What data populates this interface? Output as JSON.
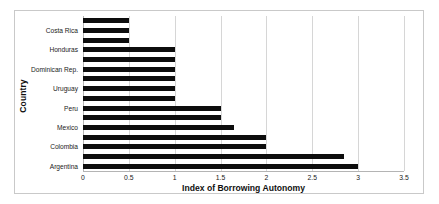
{
  "chart_data": {
    "type": "bar",
    "orientation": "horizontal",
    "title": "",
    "xlabel": "Index of Borrowing Autonomy",
    "ylabel": "Country",
    "xlim": [
      0,
      3.5
    ],
    "xticks": [
      "0",
      "0.5",
      "1",
      "1.5",
      "2",
      "2.5",
      "3",
      "3.5"
    ],
    "xtick_values": [
      0,
      0.5,
      1,
      1.5,
      2,
      2.5,
      3,
      3.5
    ],
    "grid": true,
    "grid_axis": "x",
    "legend": false,
    "bar_color": "#0d0d0d",
    "categories": [
      "",
      "Costa Rica",
      "",
      "Honduras",
      "",
      "Dominican Rep.",
      "",
      "Uruguay",
      "",
      "Peru",
      "",
      "Mexico",
      "",
      "Colombia",
      "",
      "Argentina"
    ],
    "values": [
      0.5,
      0.5,
      0.5,
      1.0,
      1.0,
      1.0,
      1.0,
      1.0,
      1.0,
      1.5,
      1.5,
      1.65,
      2.0,
      2.0,
      2.85,
      3.0
    ],
    "labeled_categories": [
      "Costa Rica",
      "Honduras",
      "Dominican Rep.",
      "Uruguay",
      "Peru",
      "Mexico",
      "Colombia",
      "Argentina"
    ]
  }
}
